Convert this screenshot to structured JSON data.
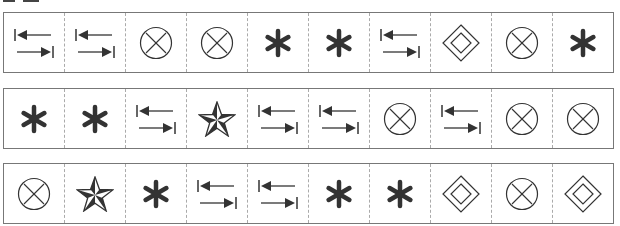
{
  "heading": {
    "text": ""
  },
  "colors": {
    "ink": "#333333",
    "border": "#777777",
    "divider": "#aaaaaa"
  },
  "rows": [
    {
      "cells": [
        "arrows",
        "arrows",
        "circle-x",
        "circle-x",
        "asterisk",
        "asterisk",
        "arrows",
        "diamond",
        "circle-x",
        "asterisk"
      ]
    },
    {
      "cells": [
        "asterisk",
        "asterisk",
        "arrows",
        "star",
        "arrows",
        "arrows",
        "circle-x",
        "arrows",
        "circle-x",
        "circle-x"
      ]
    },
    {
      "cells": [
        "circle-x",
        "star",
        "asterisk",
        "arrows",
        "arrows",
        "asterisk",
        "asterisk",
        "diamond",
        "circle-x",
        "diamond"
      ]
    }
  ]
}
